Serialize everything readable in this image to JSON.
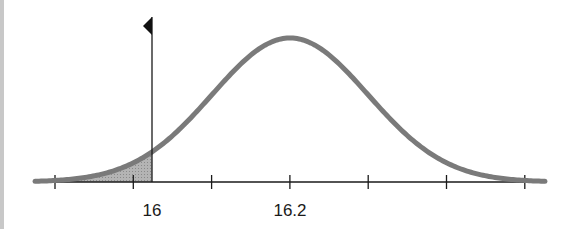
{
  "chart_data": {
    "type": "area",
    "title": "",
    "xlabel": "",
    "ylabel": "",
    "distribution": {
      "mean": 16.2,
      "tick_spacing_px": 78
    },
    "x_tick_labels": [
      {
        "label": "16",
        "position": "marker"
      },
      {
        "label": "16.2",
        "position": "mean"
      }
    ],
    "tick_count": 7,
    "marker": {
      "value": "16",
      "shape": "flag-left",
      "shaded_region": "left-tail"
    },
    "grid": false,
    "legend": null,
    "colors": {
      "curve": "#7a7a7a",
      "axis": "#1a1a1a",
      "shade": "#a8a8a8"
    }
  },
  "labels": {
    "marker_label": "16",
    "mean_label": "16.2"
  }
}
